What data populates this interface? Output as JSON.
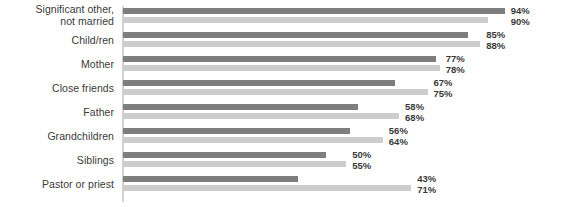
{
  "chart_data": {
    "type": "bar",
    "orientation": "horizontal",
    "title": "",
    "subtitle": "",
    "xlabel": "",
    "ylabel": "",
    "grid": false,
    "legend": false,
    "legend_position": "none",
    "xlim": [
      0,
      100
    ],
    "xunit": "%",
    "categories": [
      "Significant other,\nnot married",
      "Child/ren",
      "Mother",
      "Close friends",
      "Father",
      "Grandchildren",
      "Siblings",
      "Pastor or priest"
    ],
    "series": [
      {
        "name": "series-a",
        "color": "#7e7e7e",
        "values": [
          94,
          85,
          77,
          67,
          58,
          56,
          50,
          43
        ],
        "labels": [
          "94%",
          "85%",
          "77%",
          "67%",
          "58%",
          "56%",
          "50%",
          "43%"
        ]
      },
      {
        "name": "series-b",
        "color": "#cdcdcd",
        "values": [
          90,
          88,
          78,
          75,
          68,
          64,
          55,
          71
        ],
        "labels": [
          "90%",
          "88%",
          "78%",
          "75%",
          "68%",
          "64%",
          "55%",
          "71%"
        ]
      }
    ]
  },
  "colors": {
    "series_a": "#7e7e7e",
    "series_b": "#cdcdcd",
    "axis": "#d2d2d2",
    "text": "#3a3a3a",
    "background": "#ffffff"
  },
  "rows": [
    {
      "label": "Significant other,\nnot married",
      "two_line": true,
      "a_value": 94,
      "a_label": "94%",
      "b_value": 90,
      "b_label": "90%"
    },
    {
      "label": "Child/ren",
      "two_line": false,
      "a_value": 85,
      "a_label": "85%",
      "b_value": 88,
      "b_label": "88%"
    },
    {
      "label": "Mother",
      "two_line": false,
      "a_value": 77,
      "a_label": "77%",
      "b_value": 78,
      "b_label": "78%"
    },
    {
      "label": "Close friends",
      "two_line": false,
      "a_value": 67,
      "a_label": "67%",
      "b_value": 75,
      "b_label": "75%"
    },
    {
      "label": "Father",
      "two_line": false,
      "a_value": 58,
      "a_label": "58%",
      "b_value": 68,
      "b_label": "68%"
    },
    {
      "label": "Grandchildren",
      "two_line": false,
      "a_value": 56,
      "a_label": "56%",
      "b_value": 64,
      "b_label": "64%"
    },
    {
      "label": "Siblings",
      "two_line": false,
      "a_value": 50,
      "a_label": "50%",
      "b_value": 55,
      "b_label": "55%"
    },
    {
      "label": "Pastor or priest",
      "two_line": false,
      "a_value": 43,
      "a_label": "43%",
      "b_value": 71,
      "b_label": "71%"
    }
  ]
}
